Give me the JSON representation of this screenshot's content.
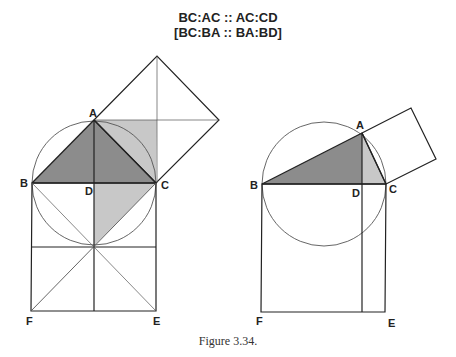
{
  "title": {
    "line1": "BC:AC :: AC:CD",
    "line2": "[BC:BA :: BA:BD]"
  },
  "figures": [
    {
      "id": "left",
      "labels": {
        "A": "A",
        "B": "B",
        "C": "C",
        "D": "D",
        "E": "E",
        "F": "F"
      },
      "description": "Isosceles right triangle ABC inscribed in semicircle on BC, square on AC, square BCEF below"
    },
    {
      "id": "right",
      "labels": {
        "A": "A",
        "B": "B",
        "C": "C",
        "D": "D",
        "E": "E",
        "F": "F"
      },
      "description": "Right triangle ABC inscribed in circle on diameter BC, square on AC, square BCEF below with line from D"
    }
  ],
  "colors": {
    "dark_fill": "#8c8c8c",
    "light_fill": "#c8c8c8",
    "line": "#222222",
    "circle": "#555555"
  },
  "caption": "Figure 3.34."
}
